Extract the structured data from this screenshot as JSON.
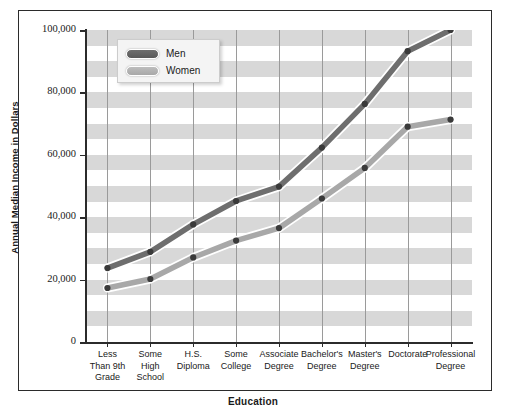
{
  "chart_data": {
    "type": "line",
    "title": "",
    "xlabel": "Education",
    "ylabel": "Annual Median Income in Dollars",
    "categories": [
      "Less Than 9th Grade",
      "Some High School",
      "H.S. Diploma",
      "Some College",
      "Associate Degree",
      "Bachelor's Degree",
      "Master's Degree",
      "Doctorate",
      "Professional Degree"
    ],
    "category_lines": [
      [
        "Less",
        "Than 9th",
        "Grade"
      ],
      [
        "Some",
        "High",
        "School"
      ],
      [
        "H.S.",
        "Diploma"
      ],
      [
        "Some",
        "College"
      ],
      [
        "Associate",
        "Degree"
      ],
      [
        "Bachelor's",
        "Degree"
      ],
      [
        "Master's",
        "Degree"
      ],
      [
        "Doctorate"
      ],
      [
        "Professional",
        "Degree"
      ]
    ],
    "series": [
      {
        "name": "Men",
        "color": "#6e6e6e",
        "values": [
          23700,
          28900,
          37700,
          45200,
          49800,
          62300,
          76300,
          93200,
          100000
        ]
      },
      {
        "name": "Women",
        "color": "#a8a8a8",
        "values": [
          17300,
          20200,
          27100,
          32500,
          36500,
          46000,
          55800,
          69000,
          71300
        ]
      }
    ],
    "ylim": [
      0,
      100000
    ],
    "ytick_values": [
      0,
      20000,
      40000,
      60000,
      80000,
      100000
    ],
    "ytick_labels": [
      "0",
      "20,000",
      "40,000",
      "60,000",
      "80,000",
      "100,000"
    ],
    "yminor_step": 5000,
    "grid": "horizontal-bands-and-vertical-lines",
    "legend_position": "top-left-inside",
    "band_color": "#d8d8d8",
    "gridline_color": "#9a9a9a",
    "marker_color": "#3a3a3a"
  },
  "legend": {
    "items": [
      {
        "label": "Men"
      },
      {
        "label": "Women"
      }
    ]
  }
}
